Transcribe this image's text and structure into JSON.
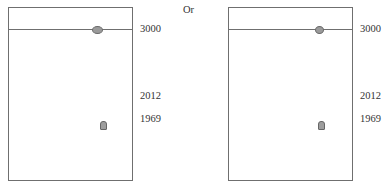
{
  "separator": "Or",
  "panels": [
    {
      "id": "left",
      "labels": {
        "top": "3000",
        "mid": "2012",
        "low": "1969"
      },
      "markers": [
        {
          "shape": "oval",
          "color": "#9a9a9a",
          "on": "3000-line"
        },
        {
          "shape": "rounded-square",
          "color": "#9d9d9d",
          "near": "1969"
        }
      ]
    },
    {
      "id": "right",
      "labels": {
        "top": "3000",
        "mid": "2012",
        "low": "1969"
      },
      "markers": [
        {
          "shape": "circle",
          "color": "#9a9a9a",
          "on": "3000-line"
        },
        {
          "shape": "rounded-square",
          "color": "#9d9d9d",
          "near": "1969"
        }
      ]
    }
  ],
  "colors": {
    "line": "#6f6f6f",
    "marker_fill": "#9a9a9a",
    "text": "#333333"
  }
}
